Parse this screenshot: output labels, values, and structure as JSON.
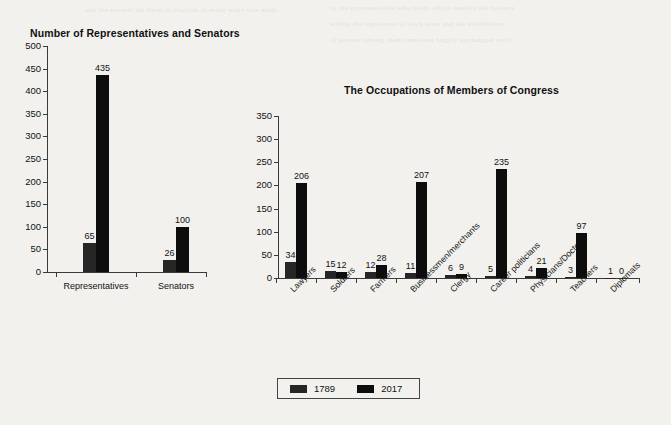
{
  "page": {
    "background": "#f2f1ee",
    "bleed_lines": [
      "and the several the form of election in many ways was made",
      "to the representative who holds office thereby the balance",
      "within the legislature of each state and the distribution",
      "of powers among them remained largely unchanged until"
    ]
  },
  "chart_data": [
    {
      "type": "bar",
      "title": "Number of Representatives and Senators",
      "categories": [
        "Representatives",
        "Senators"
      ],
      "series": [
        {
          "name": "1789",
          "values": [
            65,
            26
          ],
          "color": "#262626"
        },
        {
          "name": "2017",
          "values": [
            435,
            100
          ],
          "color": "#0d0d0d"
        }
      ],
      "xlabel": "",
      "ylabel": "",
      "ylim": [
        0,
        500
      ],
      "yticks": [
        0,
        50,
        100,
        150,
        200,
        250,
        300,
        350,
        400,
        450,
        500
      ],
      "grid": false,
      "data_labels": true
    },
    {
      "type": "bar",
      "title": "The Occupations of Members of Congress",
      "categories": [
        "Lawyers",
        "Soldiers",
        "Farmers",
        "Businessmen/merchants",
        "Clergy",
        "Career politicians",
        "Physicians/Doctors",
        "Teachers",
        "Diplomats"
      ],
      "series": [
        {
          "name": "1789",
          "values": [
            34,
            15,
            12,
            11,
            6,
            5,
            4,
            3,
            1
          ],
          "color": "#262626"
        },
        {
          "name": "2017",
          "values": [
            206,
            12,
            28,
            207,
            9,
            235,
            21,
            97,
            0
          ],
          "color": "#0d0d0d"
        }
      ],
      "xlabel": "",
      "ylabel": "",
      "ylim": [
        0,
        350
      ],
      "yticks": [
        0,
        50,
        100,
        150,
        200,
        250,
        300,
        350
      ],
      "grid": false,
      "data_labels": true
    }
  ],
  "legend": {
    "position": "bottom-center",
    "entries": [
      {
        "label": "1789",
        "color": "#262626"
      },
      {
        "label": "2017",
        "color": "#0d0d0d"
      }
    ]
  }
}
